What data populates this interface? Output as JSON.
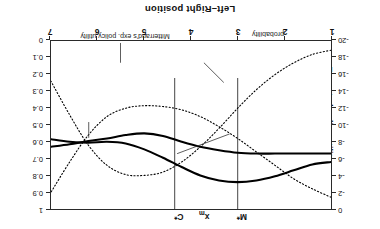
{
  "chart_data": {
    "type": "line",
    "title": "",
    "xlabel": "Left–Right position",
    "ylabel": "Expected policy utility",
    "ylabel_right": "",
    "xlim": [
      1,
      7
    ],
    "xticks": [
      1,
      2,
      3,
      4,
      5,
      6,
      7
    ],
    "ylim_left": [
      -20,
      0
    ],
    "yticks_left": [
      0,
      -2,
      -4,
      -6,
      -8,
      -10,
      -12,
      -14,
      -16,
      -18,
      -20
    ],
    "ylim_right": [
      0,
      1
    ],
    "yticks_right": [
      "0",
      "0.1",
      "0.2",
      "0.3",
      "0.4",
      "0.5",
      "0.6",
      "0.7",
      "0.8",
      "0.9",
      "1"
    ],
    "grid": false,
    "legend_position": "inline-annotations",
    "rotated_180": true,
    "markers": [
      {
        "label": "M*",
        "x": 3.0,
        "name": "mitterrand-optimum"
      },
      {
        "label": "xm",
        "x": 3.8,
        "name": "median-voter",
        "sub": "m"
      },
      {
        "label": "C*",
        "x": 4.35,
        "name": "chirac-optimum"
      }
    ],
    "series": [
      {
        "name": "Chirac's election probability",
        "axis": "right",
        "style": "dotted",
        "x": [
          1.0,
          1.4,
          1.8,
          2.2,
          2.6,
          3.0,
          3.4,
          3.8,
          4.2,
          4.6,
          5.0,
          5.4,
          5.8,
          6.2,
          6.6,
          7.0
        ],
        "values": [
          0.93,
          0.88,
          0.82,
          0.74,
          0.66,
          0.58,
          0.51,
          0.45,
          0.41,
          0.39,
          0.385,
          0.4,
          0.45,
          0.56,
          0.72,
          0.9
        ]
      },
      {
        "name": "Mitterrand's election probability",
        "axis": "right",
        "style": "dotted",
        "x": [
          1.0,
          1.4,
          1.8,
          2.2,
          2.6,
          3.0,
          3.4,
          3.8,
          4.2,
          4.6,
          5.0,
          5.4,
          5.8,
          6.2,
          6.6,
          7.0
        ],
        "values": [
          0.055,
          0.08,
          0.13,
          0.2,
          0.29,
          0.4,
          0.52,
          0.63,
          0.72,
          0.78,
          0.8,
          0.795,
          0.74,
          0.62,
          0.44,
          0.24
        ]
      },
      {
        "name": "Chirac's exp. policy utility",
        "axis": "left",
        "style": "solid",
        "x": [
          1.0,
          1.4,
          1.8,
          2.2,
          2.6,
          3.0,
          3.4,
          3.8,
          4.2,
          4.6,
          5.0,
          5.4,
          5.8,
          6.2,
          6.6,
          7.0
        ],
        "values": [
          -6.6,
          -6.6,
          -6.6,
          -6.6,
          -6.6,
          -6.7,
          -7.0,
          -7.4,
          -8.0,
          -8.7,
          -9.0,
          -8.8,
          -8.4,
          -8.1,
          -7.7,
          -7.4
        ]
      },
      {
        "name": "Mitterrand's exp. policy utility",
        "axis": "left",
        "style": "solid",
        "x": [
          1.0,
          1.4,
          1.8,
          2.2,
          2.6,
          3.0,
          3.4,
          3.8,
          4.2,
          4.6,
          5.0,
          5.4,
          5.8,
          6.2,
          6.6,
          7.0
        ],
        "values": [
          -5.6,
          -5.3,
          -4.6,
          -3.9,
          -3.4,
          -3.2,
          -3.4,
          -4.0,
          -5.0,
          -6.1,
          -7.1,
          -7.8,
          -8.0,
          -7.9,
          -8.0,
          -8.3
        ]
      }
    ],
    "annotations": [
      {
        "text_line1": "Chirac's election",
        "text_line2": "probability"
      },
      {
        "text_line1": "Mitterrand's election",
        "text_line2": "probability"
      },
      {
        "text_line1": "Chirac's exp.",
        "text_line2": "policy utility"
      },
      {
        "text_line1": "Mitterrand's exp. policy utility",
        "text_line2": ""
      }
    ]
  },
  "axes": {
    "x_title": "Left–Right position",
    "y_title_left": "Expected policy utility",
    "xticks": [
      "1",
      "2",
      "3",
      "4",
      "5",
      "6",
      "7"
    ],
    "yticks_left": [
      "0",
      "-2",
      "-4",
      "-6",
      "-8",
      "-10",
      "-12",
      "-14",
      "-16",
      "-18",
      "-20"
    ],
    "yticks_right": [
      "0",
      "0.1",
      "0.2",
      "0.3",
      "0.4",
      "0.5",
      "0.6",
      "0.7",
      "0.8",
      "0.9",
      "1"
    ]
  },
  "markers": {
    "m_star": "M*",
    "x_m_base": "x",
    "x_m_sub": "m",
    "c_star": "C*"
  },
  "annotations": {
    "chirac_prob_l1": "Chirac's election",
    "chirac_prob_l2": "probability",
    "mitterrand_prob_l1": "Mitterrand's election",
    "mitterrand_prob_l2": "probability",
    "chirac_util_l1": "Chirac's exp.",
    "chirac_util_l2": "policy utility",
    "mitterrand_util": "Mitterrand's exp. policy utility"
  }
}
